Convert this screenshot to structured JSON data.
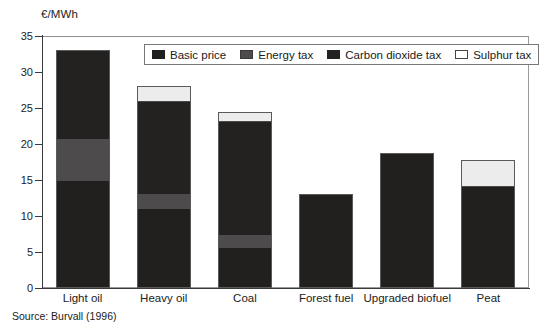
{
  "unit_label": "€/MWh",
  "source_note": "Source: Burvall (1996)",
  "legend": {
    "items": [
      {
        "label": "Basic price",
        "key": "basic",
        "color": "#221f1f"
      },
      {
        "label": "Energy tax",
        "key": "energy",
        "color": "#4d4b4b"
      },
      {
        "label": "Carbon dioxide tax",
        "key": "co2",
        "color": "#242121"
      },
      {
        "label": "Sulphur tax",
        "key": "sulphur",
        "color": "#ffffff"
      }
    ]
  },
  "axis": {
    "y_ticks": [
      "0",
      "5",
      "10",
      "15",
      "20",
      "25",
      "30",
      "35"
    ]
  },
  "chart_data": {
    "type": "bar",
    "subtype": "stacked",
    "title": "",
    "xlabel": "",
    "ylabel": "€/MWh",
    "ylim": [
      0,
      35
    ],
    "ytick_step": 5,
    "grid": false,
    "legend_position": "top-center-inside",
    "categories": [
      "Light oil",
      "Heavy oil",
      "Coal",
      "Forest fuel",
      "Upgraded biofuel",
      "Peat"
    ],
    "series": [
      {
        "name": "Basic price",
        "values": [
          14.8,
          11.0,
          5.5,
          13.0,
          18.8,
          14.0
        ]
      },
      {
        "name": "Energy tax",
        "values": [
          5.9,
          2.0,
          1.9,
          0,
          0,
          0
        ]
      },
      {
        "name": "Carbon dioxide tax",
        "values": [
          12.3,
          12.8,
          15.6,
          0,
          0,
          0
        ]
      },
      {
        "name": "Sulphur tax",
        "values": [
          0,
          2.2,
          1.5,
          0,
          0,
          3.8
        ]
      }
    ],
    "totals": [
      33.0,
      28.0,
      24.5,
      13.0,
      18.8,
      17.8
    ]
  }
}
